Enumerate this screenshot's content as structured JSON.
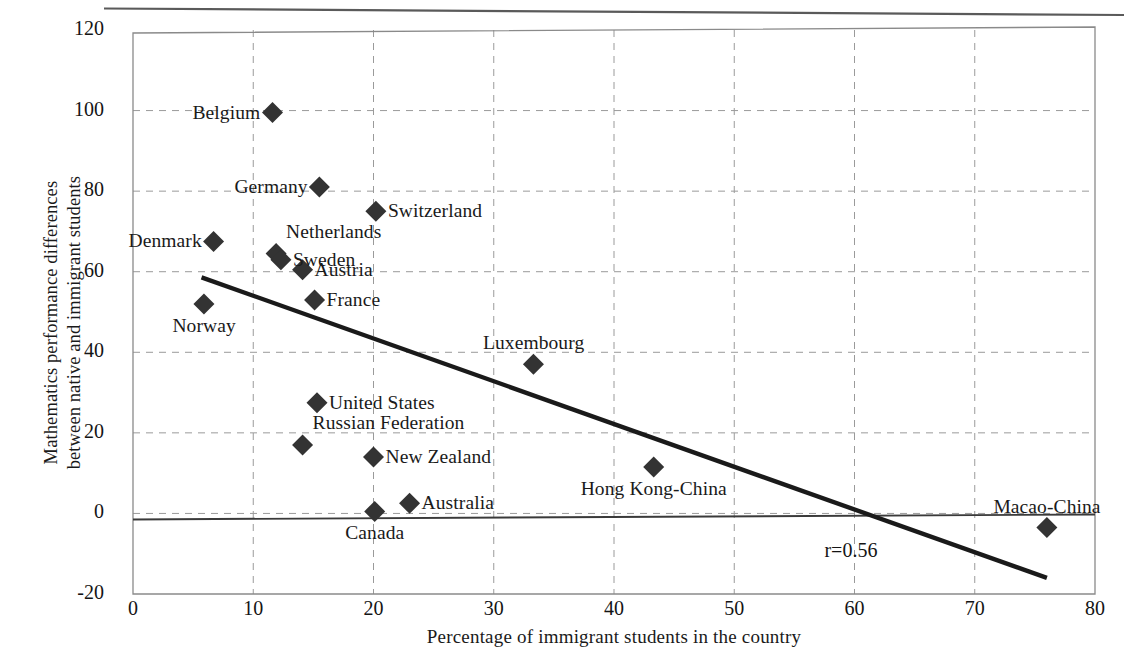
{
  "chart_data": {
    "type": "scatter",
    "title": "",
    "xlabel": "Percentage of immigrant students in the country",
    "ylabel_line1": "Mathematics performance differences",
    "ylabel_line2": "between native and immigrant students",
    "xlim": [
      0,
      80
    ],
    "ylim": [
      -20,
      120
    ],
    "xticks": [
      "0",
      "10",
      "20",
      "30",
      "40",
      "50",
      "60",
      "70",
      "80"
    ],
    "yticks": [
      "120",
      "100",
      "80",
      "60",
      "40",
      "20",
      "0",
      "-20"
    ],
    "grid": "dashed horizontal and vertical gridlines",
    "legend": "none",
    "annotations": [
      {
        "text": "r=0.56",
        "x": 57.5,
        "y": -9.5
      }
    ],
    "trendline": {
      "x0": 5.7,
      "y0": 58.6,
      "x1": 76.0,
      "y1": -16.0,
      "style": "solid thick black"
    },
    "zero_line": {
      "y": -1.0,
      "style": "solid thin black"
    },
    "marker": "filled-diamond",
    "marker_color": "#333333",
    "points": [
      {
        "label": "Belgium",
        "x": 11.6,
        "y": 99.5,
        "label_pos": "left"
      },
      {
        "label": "Germany",
        "x": 15.5,
        "y": 81.0,
        "label_pos": "left"
      },
      {
        "label": "Switzerland",
        "x": 20.2,
        "y": 75.0,
        "label_pos": "right"
      },
      {
        "label": "Denmark",
        "x": 6.7,
        "y": 67.5,
        "label_pos": "belowleft"
      },
      {
        "label": "Netherlands",
        "x": 11.9,
        "y": 64.5,
        "label_pos": "aboveright"
      },
      {
        "label": "Sweden",
        "x": 12.3,
        "y": 63.0,
        "label_pos": "right"
      },
      {
        "label": "Austria",
        "x": 14.1,
        "y": 60.5,
        "label_pos": "right"
      },
      {
        "label": "Norway",
        "x": 5.9,
        "y": 52.0,
        "label_pos": "below"
      },
      {
        "label": "France",
        "x": 15.1,
        "y": 53.0,
        "label_pos": "right"
      },
      {
        "label": "Luxembourg",
        "x": 33.3,
        "y": 37.0,
        "label_pos": "above"
      },
      {
        "label": "United States",
        "x": 15.3,
        "y": 27.5,
        "label_pos": "right"
      },
      {
        "label": "Russian Federation",
        "x": 14.1,
        "y": 17.0,
        "label_pos": "aboveright"
      },
      {
        "label": "New Zealand",
        "x": 20.0,
        "y": 14.0,
        "label_pos": "right"
      },
      {
        "label": "Australia",
        "x": 23.0,
        "y": 2.5,
        "label_pos": "right"
      },
      {
        "label": "Canada",
        "x": 20.1,
        "y": 0.5,
        "label_pos": "below"
      },
      {
        "label": "Hong Kong-China",
        "x": 43.3,
        "y": 11.5,
        "label_pos": "below"
      },
      {
        "label": "Macao-China",
        "x": 76.0,
        "y": -3.5,
        "label_pos": "above"
      }
    ]
  },
  "colors": {
    "marker": "#333333",
    "trendline": "#1a1a1a",
    "grid": "#9a9a9a",
    "frame": "#8a8a8a",
    "text": "#1a1a1a"
  }
}
